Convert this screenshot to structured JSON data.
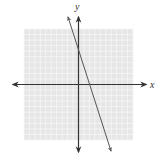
{
  "chart_data": {
    "type": "line",
    "title": "",
    "xlabel": "x",
    "ylabel": "y",
    "grid": true,
    "xlim": [
      -10,
      10
    ],
    "ylim": [
      -10,
      10
    ],
    "tick_labels": false,
    "series": [
      {
        "name": "line",
        "equation": "y = -3x + 7",
        "x": [
          -1,
          0,
          2.33,
          4.5
        ],
        "y": [
          10,
          7,
          0,
          -6.5
        ],
        "style": "double-arrowed line"
      }
    ]
  },
  "labels": {
    "x_axis": "x",
    "y_axis": "y"
  },
  "colors": {
    "grid_background": "#e6e6e6",
    "grid_lines": "#f6f6f6",
    "axes": "#333333",
    "line": "#555555"
  }
}
